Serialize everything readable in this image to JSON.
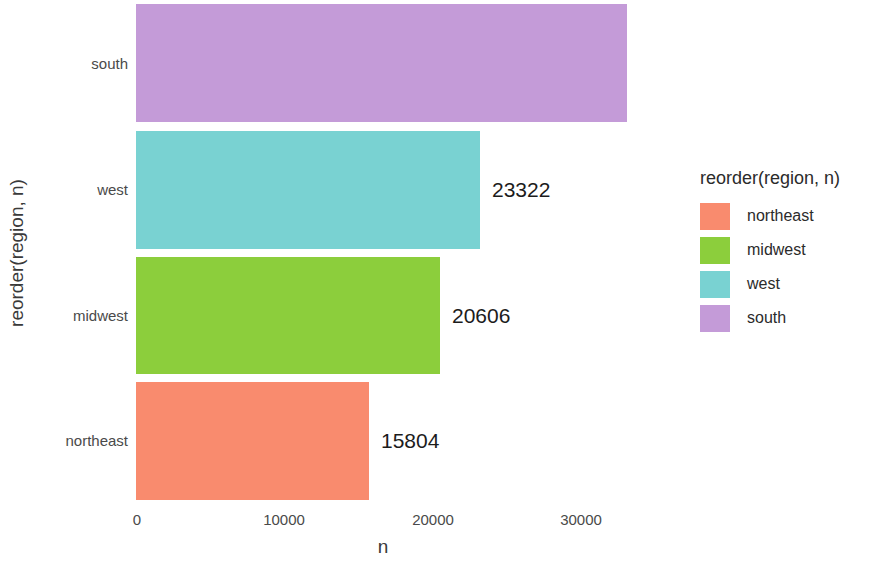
{
  "chart_data": {
    "type": "bar",
    "orientation": "horizontal",
    "title": "",
    "xlabel": "n",
    "ylabel": "reorder(region, n)",
    "categories": [
      "south",
      "west",
      "midwest",
      "northeast"
    ],
    "values": [
      33317,
      23322,
      20606,
      15804
    ],
    "data_labels": [
      "333",
      "23322",
      "20606",
      "15804"
    ],
    "data_labels_note": "south label is clipped at the panel edge, rendering as '333'",
    "xlim": [
      0,
      33500
    ],
    "xticks": [
      0,
      10000,
      20000,
      30000
    ],
    "xtick_labels": [
      "0",
      "10000",
      "20000",
      "30000"
    ],
    "grid": false,
    "legend": {
      "position": "right",
      "title": "reorder(region, n)",
      "entries": [
        {
          "label": "northeast",
          "color": "#F98B6E"
        },
        {
          "label": "midwest",
          "color": "#8CCE3C"
        },
        {
          "label": "west",
          "color": "#79D2D2"
        },
        {
          "label": "south",
          "color": "#C49BD8"
        }
      ]
    },
    "bars": [
      {
        "category": "south",
        "value": 33317,
        "label": "333",
        "color": "#C49BD8"
      },
      {
        "category": "west",
        "value": 23322,
        "label": "23322",
        "color": "#79D2D2"
      },
      {
        "category": "midwest",
        "value": 20606,
        "label": "20606",
        "color": "#8CCE3C"
      },
      {
        "category": "northeast",
        "value": 15804,
        "label": "15804",
        "color": "#F98B6E"
      }
    ]
  },
  "axes": {
    "y_title": "reorder(region, n)",
    "x_title": "n",
    "y_ticks": [
      "south",
      "west",
      "midwest",
      "northeast"
    ],
    "x_ticks": [
      "0",
      "10000",
      "20000",
      "30000"
    ]
  },
  "legend": {
    "title": "reorder(region, n)",
    "items": [
      {
        "label": "northeast",
        "color": "#F98B6E"
      },
      {
        "label": "midwest",
        "color": "#8CCE3C"
      },
      {
        "label": "west",
        "color": "#79D2D2"
      },
      {
        "label": "south",
        "color": "#C49BD8"
      }
    ]
  }
}
